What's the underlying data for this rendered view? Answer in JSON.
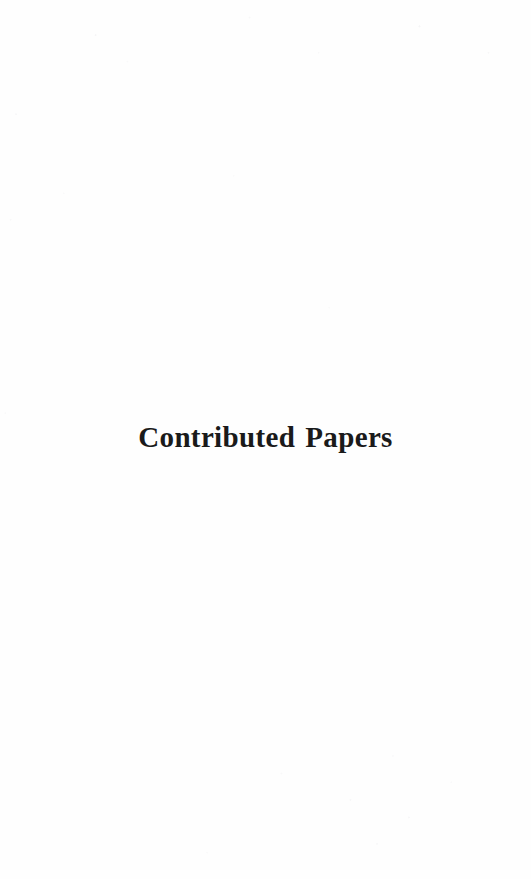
{
  "page": {
    "kind": "section-divider-page",
    "width": 531,
    "height": 879,
    "background_color": "#fefefe",
    "text_color": "#1a1a1a"
  },
  "divider": {
    "title": "Contributed Papers"
  }
}
